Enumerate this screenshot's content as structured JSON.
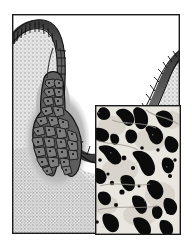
{
  "figure": {
    "name": "histology-figure",
    "type": "scientific-illustration-with-photomicrograph-inset",
    "caption": "",
    "canvas": {
      "width": 192,
      "height": 250,
      "background": "#ffffff"
    },
    "frame": {
      "name": "figure-border",
      "x": 12,
      "y": 14,
      "width": 168,
      "height": 220,
      "stroke": "#1a1a1a",
      "stroke_width": 1.4,
      "fill": "#ffffff"
    },
    "regions": {
      "lumen": {
        "label": "lumen",
        "color": "#ffffff",
        "description": "white cavity above and right of the epithelial surface"
      },
      "stroma": {
        "label": "connective-tissue-stroma",
        "color": "#e8e8e8",
        "stipple_color": "#8a8a8a",
        "description": "stippled dot-textured light gray tissue filling the frame"
      },
      "basement_halo": {
        "label": "periglandular-halo",
        "color": "#b4b4b4",
        "description": "mid-gray zone surrounding the invaginated gland"
      },
      "epithelium": {
        "label": "columnar-epithelium",
        "fill": "#5a5a5a",
        "cell_outline": "#111111",
        "description": "dark banded cell layer lining surface, duct and acinus"
      }
    },
    "inset": {
      "name": "photomicrograph-inset",
      "x": 95,
      "y": 105,
      "width": 86,
      "height": 130,
      "border_color": "#1a1a1a",
      "border_width": 1.4,
      "background": "#ebe8e2",
      "stain_color": "#0a0a0a",
      "description": "photomicrograph showing dark irregular stained profiles and round granules on a pale background"
    }
  },
  "colors": {
    "ink": "#1a1a1a",
    "epithelium": "#565656",
    "epithelium_dark": "#2e2e2e",
    "halo": "#b4b4b4",
    "stroma": "#e9e9e9",
    "stipple": "#878787",
    "lumen": "#ffffff",
    "inset_bg": "#ebe8e2",
    "inset_stain": "#0b0b0b"
  }
}
